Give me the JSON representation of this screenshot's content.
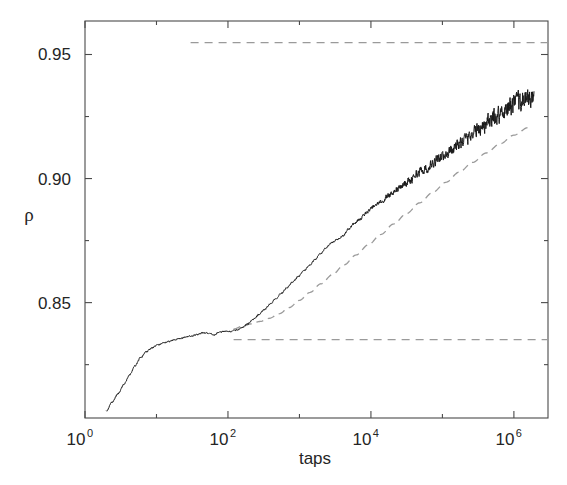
{
  "figure": {
    "background_color": "#ffffff",
    "frame_color": "#4a4a4a",
    "curve_color": "#1a1a1a",
    "fit_color": "#9a9a9a",
    "asymptote_color": "#9a9a9a"
  },
  "chart_data": {
    "type": "line",
    "title": "",
    "subtitle": "",
    "xlabel": "taps",
    "ylabel": "ρ",
    "xscale": "log",
    "yscale": "linear",
    "xlim": [
      1.0,
      3000000.0
    ],
    "ylim": [
      0.8035,
      0.9635
    ],
    "grid": false,
    "legend": null,
    "xtick_labels": [
      "10",
      "10",
      "10",
      "10"
    ],
    "xtick_exponents": [
      "0",
      "2",
      "4",
      "6"
    ],
    "xtick_values": [
      1,
      100,
      10000,
      1000000
    ],
    "xminor_ticks": [
      10,
      1000,
      100000
    ],
    "ytick_labels": [
      "0.95",
      "0.90",
      "0.85"
    ],
    "ytick_values": [
      0.95,
      0.9,
      0.85
    ],
    "yminor_ticks": [
      0.925,
      0.875,
      0.825
    ],
    "annotations": [
      {
        "name": "upper-asymptote",
        "style": "dashed",
        "y": 0.9548,
        "x_start": 30,
        "x_end": 3000000
      },
      {
        "name": "lower-asymptote",
        "style": "dashed",
        "y": 0.8351,
        "x_start": 120,
        "x_end": 3000000
      }
    ],
    "series": [
      {
        "name": "density-vs-taps",
        "style": "solid",
        "color": "#1a1a1a",
        "x": [
          2.0,
          2.4,
          2.9,
          3.5,
          4.2,
          5.0,
          6.0,
          7.2,
          8.7,
          10.4,
          12.4,
          14.9,
          17.8,
          21.4,
          25.6,
          30.7,
          36.8,
          44.1,
          52.9,
          63.4,
          76.0,
          91.0,
          109.1,
          130.8,
          156.7,
          187.8,
          225.1,
          269.8,
          323.3,
          387.4,
          464.2,
          556.3,
          666.6,
          798.8,
          957.2,
          1147.0,
          1374.6,
          1647.3,
          1974.0,
          2365.5,
          2834.6,
          3396.8,
          4070.5,
          4877.7,
          5845.0,
          7004.1,
          8393.1,
          10057.5,
          12052.2,
          14442.6,
          17307.2,
          20740.6,
          24854.8,
          29784.0,
          35690.8,
          42768.9,
          51250.0,
          61414.0,
          73595.0,
          88191.0,
          105680.0,
          126640.0,
          151760.0,
          181860.0,
          217930.0,
          261150.0,
          312940.0,
          374990.0,
          449340.0,
          538430.0,
          645190.0,
          773120.0,
          926440.0,
          1110100.0,
          1330300.0,
          1594100.0,
          1910200.0
        ],
        "y": [
          0.8065,
          0.8098,
          0.8133,
          0.817,
          0.8208,
          0.8245,
          0.8278,
          0.8302,
          0.8318,
          0.8329,
          0.8337,
          0.8344,
          0.835,
          0.8356,
          0.8361,
          0.8365,
          0.8371,
          0.8378,
          0.8377,
          0.8369,
          0.8381,
          0.8384,
          0.8384,
          0.8389,
          0.8399,
          0.8414,
          0.8432,
          0.8451,
          0.8472,
          0.8494,
          0.8516,
          0.8538,
          0.856,
          0.8582,
          0.8604,
          0.8627,
          0.865,
          0.8673,
          0.8697,
          0.8721,
          0.8742,
          0.8755,
          0.877,
          0.8796,
          0.882,
          0.8836,
          0.8858,
          0.888,
          0.8896,
          0.8907,
          0.893,
          0.8948,
          0.896,
          0.8981,
          0.8992,
          0.9018,
          0.9032,
          0.9041,
          0.9063,
          0.9078,
          0.9092,
          0.9112,
          0.9131,
          0.9146,
          0.9163,
          0.9182,
          0.9198,
          0.9214,
          0.9228,
          0.9246,
          0.9262,
          0.9278,
          0.9292,
          0.9305,
          0.9316,
          0.9322,
          0.932
        ],
        "noise_amplitude_start": 0.0004,
        "noise_amplitude_end": 0.0062,
        "noise_onset_x": 3000
      },
      {
        "name": "logarithmic-fit",
        "style": "dashed",
        "color": "#9a9a9a",
        "x": [
          120,
          160,
          210,
          280,
          380,
          520,
          720,
          1000,
          1400,
          2000,
          2900,
          4200,
          6200,
          9200,
          13800,
          20800,
          31500,
          48000,
          73000,
          112000,
          172000,
          265000,
          410000,
          640000,
          1000000,
          1600000
        ],
        "y": [
          0.8394,
          0.8405,
          0.8414,
          0.8424,
          0.8437,
          0.8455,
          0.848,
          0.8509,
          0.8541,
          0.8576,
          0.8613,
          0.8652,
          0.8692,
          0.8733,
          0.8775,
          0.8817,
          0.8859,
          0.8902,
          0.8944,
          0.8985,
          0.9026,
          0.9065,
          0.9103,
          0.914,
          0.9175,
          0.9206
        ]
      }
    ]
  },
  "geometry": {
    "plot_left": 85,
    "plot_right": 548,
    "plot_top": 21,
    "plot_bottom": 418
  }
}
